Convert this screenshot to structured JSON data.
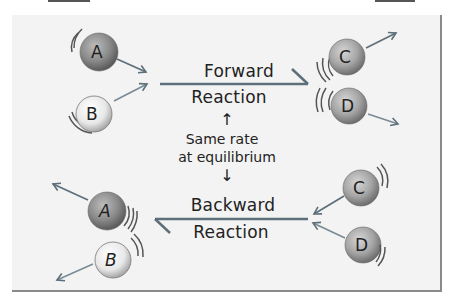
{
  "diagram": {
    "forward": {
      "label_top": "Forward",
      "label_bottom": "Reaction",
      "reactants": [
        "A",
        "B"
      ],
      "products": [
        "C",
        "D"
      ]
    },
    "backward": {
      "label_top": "Backward",
      "label_bottom": "Reaction",
      "reactants": [
        "C",
        "D"
      ],
      "products": [
        "A",
        "B"
      ]
    },
    "center_note": {
      "line1": "Same rate",
      "line2": "at equilibrium",
      "up_arrow": "↑",
      "down_arrow": "↓"
    },
    "molecules": {
      "A": {
        "label": "A",
        "color": "#8c8c8c",
        "shade": "dark"
      },
      "B": {
        "label": "B",
        "color": "#e6e6e6",
        "shade": "light"
      },
      "C": {
        "label": "C",
        "color": "#a9a9a9",
        "shade": "medium"
      },
      "D": {
        "label": "D",
        "color": "#b5b5b5",
        "shade": "medium"
      }
    },
    "colors": {
      "background": "#f3f3f3",
      "arrow": "#5c6f7a",
      "text": "#222222",
      "frame_border": "#8a8a8a"
    }
  }
}
